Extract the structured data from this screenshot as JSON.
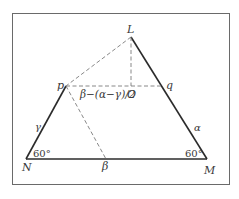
{
  "diagram": {
    "points": {
      "L": {
        "label": "L",
        "x": 131,
        "y": 37
      },
      "p": {
        "label": "p",
        "x": 66,
        "y": 86
      },
      "O": {
        "label": "O",
        "x": 131,
        "y": 86
      },
      "q": {
        "label": "q",
        "x": 162,
        "y": 86
      },
      "N": {
        "label": "N",
        "x": 26,
        "y": 159
      },
      "M": {
        "label": "M",
        "x": 207,
        "y": 159
      },
      "B": {
        "label": "β",
        "x": 106,
        "y": 159
      }
    },
    "solid_edges": [
      [
        "L",
        "M"
      ],
      [
        "N",
        "M"
      ],
      [
        "N",
        "p"
      ]
    ],
    "dashed_edges": [
      [
        "L",
        "p"
      ],
      [
        "p",
        "q"
      ],
      [
        "L",
        "O"
      ],
      [
        "p",
        "B"
      ]
    ],
    "labels": {
      "L": "L",
      "p": "p",
      "O": "O",
      "q": "q",
      "N": "N",
      "M": "M",
      "beta": "β",
      "gamma": "γ",
      "alpha": "α",
      "expression": "β−(α−γ)/2",
      "angle_N": "60°",
      "angle_M": "60°"
    },
    "colors": {
      "solid": "#2b2b2b",
      "dashed": "#7a7a7a",
      "frame": "#6a6a6a",
      "text": "#3a3a3a"
    }
  }
}
